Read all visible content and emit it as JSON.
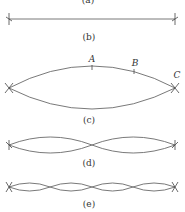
{
  "figure": {
    "panels": [
      {
        "id": "a",
        "label": "(a)",
        "harmonic": 0,
        "visible": "clipped"
      },
      {
        "id": "b",
        "label": "(b)",
        "harmonic": 0,
        "description": "string at rest"
      },
      {
        "id": "c",
        "label": "(c)",
        "harmonic": 1,
        "points": [
          {
            "name": "A"
          },
          {
            "name": "B"
          },
          {
            "name": "C"
          }
        ]
      },
      {
        "id": "d",
        "label": "(d)",
        "harmonic": 2
      },
      {
        "id": "e",
        "label": "(e)",
        "harmonic": 4
      }
    ],
    "colors": {
      "string": "#6a6a6a",
      "text": "#333333"
    }
  }
}
